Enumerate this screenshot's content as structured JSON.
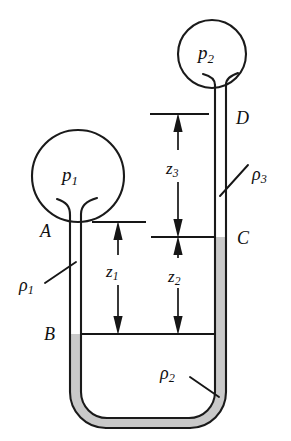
{
  "figure": {
    "type": "u-tube-manometer-diagram",
    "background_color": "#ffffff",
    "line_color": "#1a1a1a",
    "fluid_color": "#c9c9c9"
  },
  "bulbs": [
    {
      "id": "left-bulb",
      "label_base": "p",
      "label_sub": "1",
      "label_text": "p1",
      "cx": 78,
      "cy": 176,
      "r": 46
    },
    {
      "id": "right-bulb",
      "label_base": "p",
      "label_sub": "2",
      "label_text": "p2",
      "cx": 212,
      "cy": 54,
      "r": 34
    }
  ],
  "point_labels": [
    {
      "id": "point-a",
      "text": "A",
      "x": 40,
      "y": 222
    },
    {
      "id": "point-b",
      "text": "B",
      "x": 44,
      "y": 325
    },
    {
      "id": "point-c",
      "text": "C",
      "x": 237,
      "y": 229
    },
    {
      "id": "point-d",
      "text": "D",
      "x": 236,
      "y": 109
    }
  ],
  "density_labels": [
    {
      "id": "density-1",
      "base": "ρ",
      "sub": "1",
      "text": "ρ1",
      "x": 19,
      "y": 276
    },
    {
      "id": "density-2",
      "base": "ρ",
      "sub": "2",
      "text": "ρ2",
      "x": 160,
      "y": 364
    },
    {
      "id": "density-3",
      "base": "ρ",
      "sub": "3",
      "text": "ρ3",
      "x": 252,
      "y": 165
    }
  ],
  "dimension_labels": [
    {
      "id": "dim-z1",
      "base": "z",
      "sub": "1",
      "text": "z1",
      "x": 106,
      "y": 263
    },
    {
      "id": "dim-z2",
      "base": "z",
      "sub": "2",
      "text": "z2",
      "x": 168,
      "y": 268
    },
    {
      "id": "dim-z3",
      "base": "z",
      "sub": "3",
      "text": "z3",
      "x": 166,
      "y": 160
    }
  ],
  "dimensions": [
    {
      "id": "z1",
      "top_y": 222,
      "bottom_y": 334,
      "axis_x": 118
    },
    {
      "id": "z2",
      "top_y": 237,
      "bottom_y": 334,
      "axis_x": 178
    },
    {
      "id": "z3",
      "top_y": 114,
      "bottom_y": 237,
      "axis_x": 178
    }
  ],
  "level_lines": [
    {
      "id": "z1-top-line",
      "x1": 92,
      "x2": 146,
      "y": 222
    },
    {
      "id": "c-level-line",
      "x1": 151,
      "x2": 216,
      "y": 237
    },
    {
      "id": "z3-top-line",
      "x1": 150,
      "x2": 209,
      "y": 114
    },
    {
      "id": "b-level-line",
      "x1": 80,
      "x2": 216,
      "y": 334
    }
  ],
  "fluid_levels": {
    "left_tube_mercury_top_y": 334,
    "right_tube_mercury_top_y": 237
  }
}
